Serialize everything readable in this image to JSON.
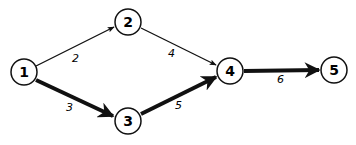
{
  "nodes": [
    {
      "id": "1",
      "label": "1",
      "x": 24,
      "y": 72
    },
    {
      "id": "2",
      "label": "2",
      "x": 128,
      "y": 22
    },
    {
      "id": "3",
      "label": "3",
      "x": 128,
      "y": 121
    },
    {
      "id": "4",
      "label": "4",
      "x": 230,
      "y": 71
    },
    {
      "id": "5",
      "label": "5",
      "x": 334,
      "y": 70
    }
  ],
  "edges": [
    {
      "from": "1",
      "to": "2",
      "weight": "2",
      "critical": false
    },
    {
      "from": "1",
      "to": "3",
      "weight": "3",
      "critical": true
    },
    {
      "from": "2",
      "to": "4",
      "weight": "4",
      "critical": false
    },
    {
      "from": "3",
      "to": "4",
      "weight": "5",
      "critical": true
    },
    {
      "from": "4",
      "to": "5",
      "weight": "6",
      "critical": true
    }
  ],
  "colors": {
    "stroke": "#111111",
    "background": "#ffffff"
  }
}
